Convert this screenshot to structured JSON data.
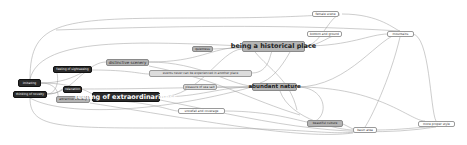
{
  "diagram": {
    "type": "network graph",
    "nodes": [
      {
        "id": "imitating",
        "label": "imitating",
        "style": "dark"
      },
      {
        "id": "thinking_of_novelty",
        "label": "thinking of novelty",
        "style": "dark"
      },
      {
        "id": "feeling_of_sightseeing",
        "label": "feeling of sightseeing",
        "style": "dark"
      },
      {
        "id": "relaxation",
        "label": "relaxation",
        "style": "dark"
      },
      {
        "id": "attractive_scenery",
        "label": "attractive scenery",
        "style": "gray"
      },
      {
        "id": "distinctive_scenery",
        "label": "distinctive scenery",
        "style": "gray"
      },
      {
        "id": "feeling_of_extraordinariness",
        "label": "feeling of extraordinariness",
        "style": "dark"
      },
      {
        "id": "quietness",
        "label": "quietness",
        "style": "gray"
      },
      {
        "id": "events_never",
        "label": "events never can be experienced in another place",
        "style": "light"
      },
      {
        "id": "pleasure_of_sea_salt",
        "label": "pleasure of sea salt",
        "style": "light"
      },
      {
        "id": "being_historical_place",
        "label": "being a historical place",
        "style": "gray"
      },
      {
        "id": "abundant_nature",
        "label": "abundant nature",
        "style": "gray"
      },
      {
        "id": "snowfall_and_coverage",
        "label": "snowfall and coverage",
        "style": "white"
      },
      {
        "id": "female_scene",
        "label": "female scene",
        "style": "white"
      },
      {
        "id": "bottom_and_ground",
        "label": "bottom and ground",
        "style": "white"
      },
      {
        "id": "mountains",
        "label": "mountains",
        "style": "white"
      },
      {
        "id": "beautiful_culture",
        "label": "beautiful culture",
        "style": "gray"
      },
      {
        "id": "basin_area",
        "label": "basin area",
        "style": "white"
      },
      {
        "id": "more_proper_style",
        "label": "more proper style",
        "style": "white"
      }
    ]
  }
}
